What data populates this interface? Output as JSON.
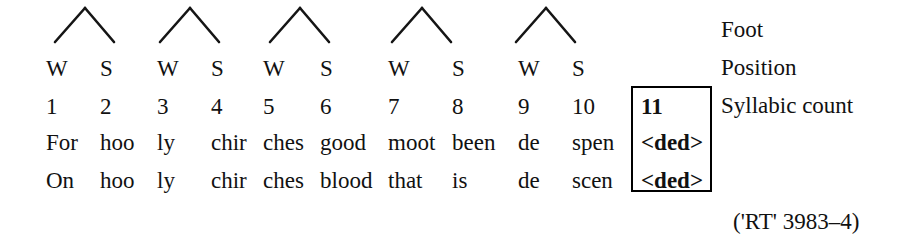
{
  "figure": {
    "type": "metrical-scansion-diagram",
    "columns": 11,
    "citation": "('RT' 3983–4)"
  },
  "feet": [
    {
      "index": 1,
      "apex_x": 85,
      "left_x": 55,
      "right_x": 114,
      "top_y": 8,
      "bottom_y": 42
    },
    {
      "index": 2,
      "apex_x": 190,
      "left_x": 160,
      "right_x": 219,
      "top_y": 8,
      "bottom_y": 42
    },
    {
      "index": 3,
      "apex_x": 300,
      "left_x": 270,
      "right_x": 329,
      "top_y": 8,
      "bottom_y": 42
    },
    {
      "index": 4,
      "apex_x": 422,
      "left_x": 392,
      "right_x": 451,
      "top_y": 8,
      "bottom_y": 42
    },
    {
      "index": 5,
      "apex_x": 546,
      "left_x": 516,
      "right_x": 575,
      "top_y": 8,
      "bottom_y": 42
    }
  ],
  "rows": {
    "strength": {
      "label": "Foot",
      "values": [
        "W",
        "S",
        "W",
        "S",
        "W",
        "S",
        "W",
        "S",
        "W",
        "S"
      ]
    },
    "position": {
      "label": "Position",
      "values": [
        "1",
        "2",
        "3",
        "4",
        "5",
        "6",
        "7",
        "8",
        "9",
        "10",
        "11"
      ]
    },
    "syllabic_count": {
      "label": "Syllabic count"
    },
    "line_a": {
      "values": [
        "For",
        "hoo",
        "ly",
        "chir",
        "ches",
        "good",
        "moot",
        "been",
        "de",
        "spen",
        "<ded>"
      ]
    },
    "line_b": {
      "values": [
        "On",
        "hoo",
        "ly",
        "chir",
        "ches",
        "blood",
        "that",
        "is",
        "de",
        "scen",
        "<ded>"
      ]
    }
  },
  "column_x": [
    46,
    100,
    157,
    211,
    263,
    320,
    388,
    452,
    518,
    572,
    641
  ],
  "side_labels": {
    "foot": "Foot",
    "position": "Position",
    "syllabic_count": "Syllabic count"
  },
  "colors": {
    "ink": "#111111",
    "box_border": "#000000",
    "background": "#ffffff"
  }
}
